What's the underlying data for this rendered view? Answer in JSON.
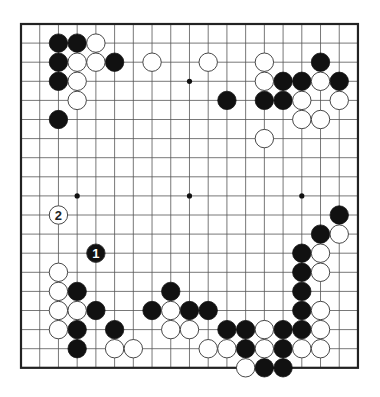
{
  "board": {
    "size": 19,
    "origin_x": 21,
    "origin_y": 24,
    "step_x": 18.72,
    "step_y": 19.1,
    "line_color": "#555555",
    "border_color": "#222222",
    "star_points": [
      [
        3,
        3
      ],
      [
        9,
        3
      ],
      [
        15,
        3
      ],
      [
        3,
        9
      ],
      [
        9,
        9
      ],
      [
        15,
        9
      ],
      [
        3,
        15
      ],
      [
        9,
        15
      ],
      [
        15,
        15
      ]
    ]
  },
  "stones": {
    "black": [
      [
        2,
        1
      ],
      [
        3,
        1
      ],
      [
        2,
        2
      ],
      [
        5,
        2
      ],
      [
        2,
        3
      ],
      [
        2,
        5
      ],
      [
        16,
        2
      ],
      [
        14,
        3
      ],
      [
        15,
        3
      ],
      [
        17,
        3
      ],
      [
        11,
        4
      ],
      [
        13,
        4
      ],
      [
        14,
        4
      ],
      [
        3,
        14
      ],
      [
        4,
        15
      ],
      [
        3,
        16
      ],
      [
        3,
        17
      ],
      [
        5,
        16
      ],
      [
        8,
        14
      ],
      [
        7,
        15
      ],
      [
        9,
        15
      ],
      [
        10,
        15
      ],
      [
        17,
        10
      ],
      [
        16,
        11
      ],
      [
        15,
        12
      ],
      [
        15,
        13
      ],
      [
        15,
        14
      ],
      [
        15,
        15
      ],
      [
        11,
        16
      ],
      [
        12,
        16
      ],
      [
        14,
        16
      ],
      [
        15,
        16
      ],
      [
        12,
        17
      ],
      [
        14,
        17
      ],
      [
        13,
        18
      ],
      [
        14,
        18
      ]
    ],
    "white": [
      [
        4,
        1
      ],
      [
        3,
        2
      ],
      [
        4,
        2
      ],
      [
        7,
        2
      ],
      [
        3,
        3
      ],
      [
        3,
        4
      ],
      [
        10,
        2
      ],
      [
        13,
        2
      ],
      [
        13,
        3
      ],
      [
        16,
        3
      ],
      [
        15,
        4
      ],
      [
        17,
        4
      ],
      [
        15,
        5
      ],
      [
        16,
        5
      ],
      [
        13,
        6
      ],
      [
        2,
        13
      ],
      [
        2,
        14
      ],
      [
        2,
        15
      ],
      [
        3,
        15
      ],
      [
        2,
        16
      ],
      [
        5,
        17
      ],
      [
        6,
        17
      ],
      [
        8,
        15
      ],
      [
        8,
        16
      ],
      [
        9,
        16
      ],
      [
        17,
        11
      ],
      [
        16,
        12
      ],
      [
        16,
        13
      ],
      [
        16,
        15
      ],
      [
        13,
        16
      ],
      [
        16,
        16
      ],
      [
        10,
        17
      ],
      [
        11,
        17
      ],
      [
        13,
        17
      ],
      [
        15,
        17
      ],
      [
        16,
        17
      ],
      [
        12,
        18
      ]
    ]
  },
  "labeled_moves": [
    {
      "color": "black",
      "x": 4,
      "y": 12,
      "label": "1"
    },
    {
      "color": "white",
      "x": 2,
      "y": 10,
      "label": "2"
    }
  ]
}
